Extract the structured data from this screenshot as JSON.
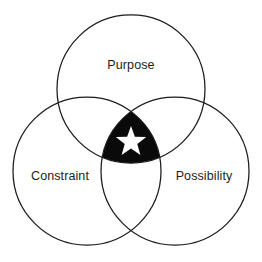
{
  "diagram": {
    "type": "venn-3-circle",
    "title": "",
    "background_color": "#ffffff",
    "stroke_color": "#1b1b1b",
    "core_fill_color": "#0a0a0a",
    "star_color": "#ffffff",
    "label_color": "#1d1d1d",
    "circle_radius": 74,
    "sets": [
      {
        "id": "purpose",
        "label": "Purpose",
        "position": "top",
        "center_x": 131,
        "center_y": 89,
        "radius": 74
      },
      {
        "id": "constraint",
        "label": "Constraint",
        "position": "bottom-left",
        "center_x": 87,
        "center_y": 171,
        "radius": 74
      },
      {
        "id": "possibility",
        "label": "Possibility",
        "position": "bottom-right",
        "center_x": 175,
        "center_y": 171,
        "radius": 74
      }
    ],
    "center_region": {
      "id": "sweet-spot",
      "fill": "#0a0a0a",
      "icon": "star-icon",
      "icon_points": 5,
      "icon_center_x": 131,
      "icon_center_y": 142,
      "icon_outer_radius": 16,
      "icon_inner_radius": 6.6,
      "label": ""
    }
  }
}
